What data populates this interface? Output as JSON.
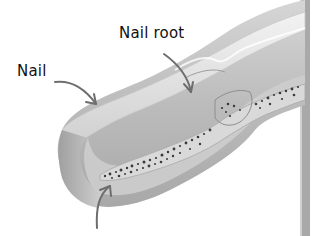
{
  "figure": {
    "labels": {
      "nail": "Nail",
      "nail_root": "Nail root"
    },
    "arrows": [
      {
        "name": "nail-arrow",
        "points_to": "nail plate"
      },
      {
        "name": "nail-root-arrow",
        "points_to": "nail root"
      },
      {
        "name": "bone-arrow",
        "points_to": "finger bone (unlabeled)"
      }
    ],
    "colors": {
      "background": "#ffffff",
      "skin_dark": "#9a9a9a",
      "skin_mid": "#bdbdbd",
      "skin_light": "#dcdcdc",
      "nail": "#e8e8e8",
      "bone_marrow_dots": "#3a3a3a",
      "arrow": "#6e6e6e",
      "text": "#111111"
    }
  }
}
